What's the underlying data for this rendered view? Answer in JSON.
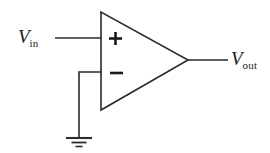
{
  "figure": {
    "kind": "circuit-schematic",
    "width": 270,
    "height": 153,
    "background_color": "#ffffff",
    "line_color": "#2b2b2b",
    "text_color": "#1a1a1a"
  },
  "labels": {
    "input": {
      "symbol": "V",
      "subscript": "in"
    },
    "output": {
      "symbol": "V",
      "subscript": "out"
    }
  },
  "opamp": {
    "plus_sign": "+",
    "minus_sign": "−",
    "triangle": {
      "top_left_x": 101,
      "top_left_y": 12,
      "bottom_left_x": 101,
      "bottom_left_y": 110,
      "apex_x": 188,
      "apex_y": 60
    },
    "noninverting_input_y": 38,
    "inverting_input_y": 72
  },
  "wires": {
    "input_wire": {
      "x1": 55,
      "y1": 38,
      "x2": 101,
      "y2": 38
    },
    "output_wire": {
      "x1": 188,
      "y1": 60,
      "x2": 228,
      "y2": 60
    },
    "feedback_to_ground_horizontal": {
      "x1": 79,
      "y1": 72,
      "x2": 101,
      "y2": 72
    },
    "feedback_to_ground_vertical": {
      "x1": 79,
      "y1": 72,
      "x2": 79,
      "y2": 138
    }
  },
  "ground": {
    "stem_x": 79,
    "bar_top_y": 138,
    "bar_mid_y": 142,
    "bar_bottom_y": 146,
    "bar_top_halfwidth": 13,
    "bar_mid_halfwidth": 7.5,
    "bar_bottom_halfwidth": 3.5
  }
}
